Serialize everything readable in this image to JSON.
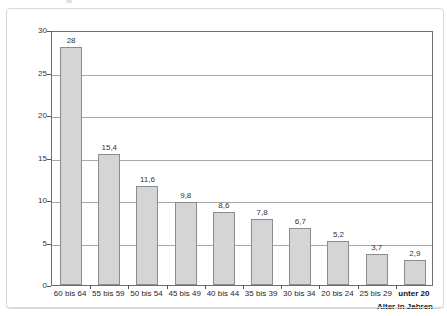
{
  "chart_data": {
    "type": "bar",
    "title": "",
    "subtitle": "",
    "xlabel": "Alter in Jahren",
    "ylabel": "Dauer in Monaten",
    "categories": [
      "60 bis 64",
      "55 bis 59",
      "50 bis 54",
      "45 bis 49",
      "40 bis 44",
      "35 bis 39",
      "30 bis 34",
      "20 bis 24",
      "25 bis 29",
      "unter 20"
    ],
    "values": [
      28,
      15.4,
      11.6,
      9.8,
      8.6,
      7.8,
      6.7,
      5.2,
      3.7,
      2.9
    ],
    "value_labels": [
      "28",
      "15,4",
      "11,6",
      "9,8",
      "8,6",
      "7,8",
      "6,7",
      "5,2",
      "3,7",
      "2,9"
    ],
    "ylim": [
      0,
      30
    ],
    "ytick_values": [
      0,
      5,
      10,
      15,
      20,
      25,
      30
    ],
    "ytick_labels": [
      "0",
      "5",
      "10",
      "15",
      "20",
      "25",
      "30"
    ],
    "grid": "horizontal",
    "legend": "none",
    "emphasized_categories": [
      "unter 20"
    ],
    "series": [
      {
        "name": "Dauer in Monaten",
        "values": [
          28,
          15.4,
          11.6,
          9.8,
          8.6,
          7.8,
          6.7,
          5.2,
          3.7,
          2.9
        ]
      }
    ],
    "colors": {
      "bar_fill": "#d5d5d5",
      "bar_border": "#8c8c8c",
      "gridline": "#a8a8a8",
      "axis": "#6e6e6e",
      "text": "#333333",
      "frame": "#d8d8d8",
      "background": "#ffffff"
    }
  }
}
